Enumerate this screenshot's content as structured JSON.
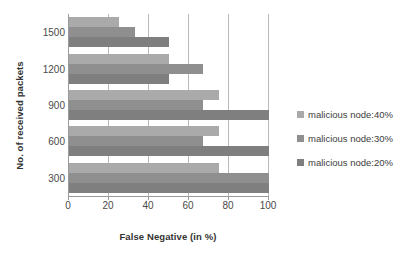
{
  "chart_data": {
    "type": "bar",
    "orientation": "horizontal",
    "title": "",
    "xlabel": "False Negative (in %)",
    "ylabel": "No. of received packets",
    "categories": [
      "1500",
      "1200",
      "900",
      "600",
      "300"
    ],
    "xticks": [
      "0",
      "20",
      "40",
      "60",
      "80",
      "100"
    ],
    "xlim": [
      0,
      100
    ],
    "grid": "vertical",
    "legend_position": "right",
    "series": [
      {
        "name": "malicious node:40%",
        "color": "#aaaaaa",
        "values": [
          25,
          50,
          75,
          75,
          75
        ]
      },
      {
        "name": "malicious node:30%",
        "color": "#8f8f8f",
        "values": [
          33,
          67,
          67,
          67,
          100
        ]
      },
      {
        "name": "malicious node:20%",
        "color": "#7f7f7f",
        "values": [
          50,
          50,
          100,
          100,
          100
        ]
      }
    ]
  }
}
